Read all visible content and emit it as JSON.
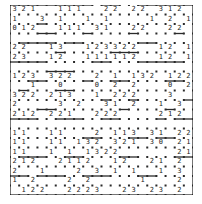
{
  "puzzle": {
    "type": "slitherlink",
    "rows": 20,
    "cols": 20,
    "colors": {
      "line": "#2a2a2a",
      "dot": "#2a2a2a",
      "clue": "#222222",
      "background": "#ffffff"
    },
    "clues": [
      [
        "3",
        "2",
        "1",
        "",
        "",
        "1",
        "1",
        "1",
        "",
        "",
        "2",
        "2",
        "",
        "2",
        "2",
        "",
        "3",
        "1",
        "2",
        ""
      ],
      [
        "1",
        "",
        "",
        "3",
        "",
        "1",
        "",
        "",
        "1",
        "",
        "1",
        "",
        "",
        "",
        "",
        "1",
        "",
        "2",
        "",
        "1"
      ],
      [
        "0",
        "1",
        "2",
        "",
        "",
        "1",
        "1",
        "1",
        "",
        "3",
        "1",
        "",
        "",
        "2",
        "2",
        "",
        "",
        "2",
        "2",
        ""
      ],
      [
        "",
        "",
        "",
        "",
        "",
        "",
        "",
        "",
        "",
        "",
        "",
        "",
        "",
        "",
        "",
        "",
        "",
        "",
        "",
        ""
      ],
      [
        "2",
        "2",
        "",
        "",
        "1",
        "3",
        "",
        "",
        "1",
        "2",
        "3",
        "3",
        "2",
        "2",
        "",
        "",
        "1",
        "2",
        "",
        "1"
      ],
      [
        "2",
        "3",
        "",
        "",
        "1",
        "2",
        "",
        "",
        "1",
        "1",
        "1",
        "1",
        "1",
        "2",
        "",
        "",
        "1",
        "2",
        "",
        "1"
      ],
      [
        "",
        "",
        "",
        "",
        "",
        "",
        "",
        "",
        "",
        "",
        "",
        "",
        "",
        "",
        "",
        "",
        "",
        "",
        "",
        ""
      ],
      [
        "1",
        "2",
        "3",
        "",
        "3",
        "2",
        "2",
        "",
        "",
        "2",
        "",
        "1",
        "",
        "1",
        "3",
        "2",
        "",
        "1",
        "2",
        "2"
      ],
      [
        "",
        "",
        "1",
        "",
        "",
        "0",
        "",
        "",
        "",
        "0",
        "",
        "2",
        "",
        "2",
        "",
        "",
        "",
        "0",
        "",
        "2"
      ],
      [
        "3",
        "2",
        "2",
        "",
        "2",
        "1",
        "3",
        "",
        "",
        "1",
        "",
        "2",
        "2",
        "2",
        "",
        "",
        "",
        "3",
        "",
        ""
      ],
      [
        "2",
        "",
        "",
        "",
        "",
        "3",
        "",
        "2",
        "",
        "",
        "3",
        "1",
        "",
        "2",
        "",
        "",
        "1",
        "",
        "3",
        ""
      ],
      [
        "2",
        "1",
        "2",
        "",
        "2",
        "2",
        "1",
        "",
        "",
        "2",
        "2",
        "2",
        "",
        "",
        "",
        "",
        "2",
        "1",
        "2",
        ""
      ],
      [
        "",
        "",
        "",
        "",
        "",
        "",
        "",
        "",
        "",
        "",
        "",
        "",
        "",
        "",
        "",
        "",
        "",
        "",
        "",
        ""
      ],
      [
        "1",
        "1",
        "",
        "",
        "1",
        "1",
        "",
        "",
        "",
        "2",
        "",
        "1",
        "1",
        "3",
        "",
        "3",
        "1",
        "",
        "2",
        "2"
      ],
      [
        "1",
        "1",
        "",
        "",
        "1",
        "1",
        "",
        "1",
        "3",
        "2",
        "",
        "3",
        "2",
        "1",
        "",
        "3",
        "0",
        "",
        "2",
        "1"
      ],
      [
        "1",
        "1",
        "",
        "",
        "1",
        "",
        "1",
        "",
        "1",
        "3",
        "2",
        "2",
        "",
        "",
        "",
        "",
        "",
        "",
        "2",
        "1"
      ],
      [
        "2",
        "1",
        "2",
        "",
        "",
        "2",
        "1",
        "1",
        "2",
        "",
        "",
        "1",
        "2",
        "",
        "",
        "2",
        "1",
        "",
        "2",
        ""
      ],
      [
        "2",
        "",
        "",
        "1",
        "",
        "",
        "",
        "2",
        "",
        "3",
        "",
        "1",
        "",
        "1",
        "",
        "",
        "1",
        "",
        "3",
        ""
      ],
      [
        "1",
        "",
        "2",
        "",
        "",
        "",
        "2",
        "",
        "2",
        "",
        "",
        "",
        "",
        "",
        "1",
        "",
        "",
        "",
        "2",
        ""
      ],
      [
        "",
        "1",
        "2",
        "2",
        "",
        "",
        "2",
        "2",
        "2",
        "3",
        "",
        "",
        "2",
        "3",
        "",
        "2",
        "3",
        "",
        "2",
        ""
      ]
    ],
    "loop_h": [
      [
        1,
        1,
        1,
        1,
        1,
        1,
        1,
        1,
        1,
        0,
        1,
        1,
        0,
        0,
        1,
        1,
        1,
        1,
        1,
        1
      ],
      [
        0,
        0,
        0,
        0,
        0,
        0,
        0,
        0,
        0,
        0,
        0,
        0,
        0,
        0,
        0,
        0,
        0,
        0,
        0,
        0
      ],
      [
        0,
        0,
        0,
        1,
        0,
        0,
        0,
        0,
        0,
        0,
        0,
        0,
        0,
        0,
        0,
        0,
        0,
        0,
        0,
        0
      ],
      [
        0,
        0,
        0,
        1,
        1,
        0,
        0,
        0,
        1,
        0,
        0,
        0,
        0,
        1,
        0,
        0,
        0,
        0,
        1,
        0
      ],
      [
        0,
        1,
        1,
        1,
        1,
        0,
        1,
        1,
        0,
        0,
        0,
        0,
        0,
        0,
        1,
        1,
        0,
        0,
        0,
        0
      ],
      [
        0,
        0,
        0,
        0,
        0,
        1,
        0,
        0,
        0,
        0,
        0,
        1,
        1,
        1,
        0,
        0,
        0,
        0,
        0,
        0
      ],
      [
        1,
        1,
        1,
        1,
        0,
        0,
        0,
        0,
        0,
        1,
        1,
        0,
        0,
        0,
        1,
        1,
        1,
        1,
        1,
        0
      ],
      [
        0,
        0,
        0,
        0,
        1,
        1,
        1,
        0,
        0,
        0,
        0,
        0,
        0,
        0,
        0,
        0,
        0,
        0,
        0,
        0
      ],
      [
        0,
        0,
        1,
        1,
        0,
        0,
        0,
        0,
        1,
        0,
        0,
        1,
        1,
        0,
        0,
        0,
        0,
        1,
        1,
        0
      ],
      [
        0,
        1,
        0,
        0,
        0,
        1,
        1,
        0,
        0,
        0,
        0,
        0,
        0,
        0,
        0,
        0,
        0,
        0,
        0,
        0
      ],
      [
        0,
        0,
        0,
        0,
        0,
        0,
        0,
        0,
        0,
        0,
        1,
        0,
        0,
        1,
        0,
        0,
        0,
        0,
        0,
        1
      ],
      [
        0,
        0,
        0,
        1,
        1,
        0,
        0,
        0,
        0,
        0,
        0,
        0,
        1,
        0,
        0,
        0,
        0,
        1,
        0,
        0
      ],
      [
        1,
        1,
        1,
        0,
        0,
        1,
        1,
        1,
        0,
        0,
        1,
        1,
        0,
        0,
        0,
        0,
        1,
        0,
        1,
        1
      ],
      [
        0,
        0,
        0,
        0,
        0,
        0,
        0,
        0,
        0,
        0,
        0,
        0,
        0,
        0,
        0,
        0,
        0,
        0,
        0,
        0
      ],
      [
        0,
        0,
        0,
        0,
        0,
        0,
        0,
        0,
        1,
        1,
        0,
        0,
        0,
        1,
        1,
        0,
        1,
        1,
        0,
        0
      ],
      [
        0,
        0,
        0,
        0,
        0,
        0,
        0,
        0,
        0,
        0,
        0,
        0,
        0,
        0,
        0,
        0,
        0,
        0,
        0,
        0
      ],
      [
        0,
        1,
        1,
        1,
        0,
        0,
        1,
        1,
        0,
        0,
        0,
        0,
        1,
        1,
        0,
        0,
        0,
        0,
        1,
        1
      ],
      [
        0,
        0,
        0,
        0,
        0,
        0,
        0,
        0,
        0,
        0,
        0,
        0,
        0,
        0,
        0,
        0,
        0,
        0,
        0,
        0
      ],
      [
        1,
        1,
        0,
        1,
        1,
        1,
        0,
        0,
        1,
        1,
        1,
        0,
        0,
        0,
        1,
        1,
        0,
        0,
        0,
        0
      ],
      [
        0,
        0,
        0,
        0,
        0,
        0,
        0,
        0,
        0,
        0,
        0,
        0,
        0,
        0,
        0,
        0,
        0,
        0,
        0,
        0
      ],
      [
        1,
        1,
        1,
        1,
        1,
        1,
        1,
        1,
        1,
        1,
        1,
        1,
        1,
        1,
        1,
        1,
        1,
        1,
        1,
        1
      ]
    ]
  }
}
